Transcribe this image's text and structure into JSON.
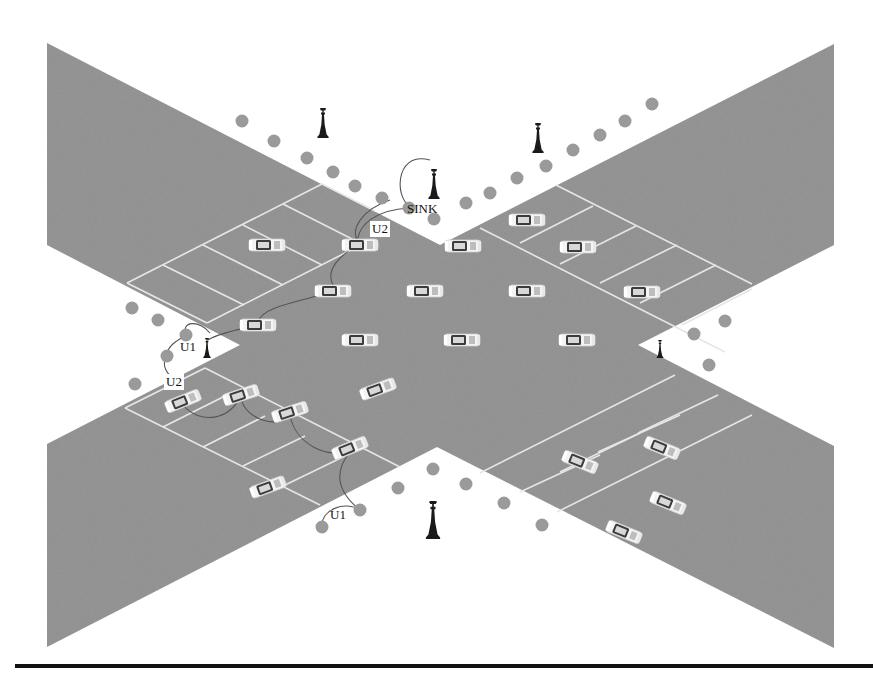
{
  "diagram": {
    "canvas": {
      "width": 873,
      "height": 685
    },
    "colors": {
      "background": "#ffffff",
      "road": "#8e8e8e",
      "road_lines": "#e6e6e6",
      "sensor_node": "#9a9a9a",
      "tower": "#1a1a1a",
      "car_body": "#f2f2f2",
      "car_cabin": "#3a3a3a",
      "link_arc": "#555555",
      "rule": "#111111"
    },
    "road_polygon": [
      [
        47,
        43
      ],
      [
        440,
        245
      ],
      [
        834,
        44
      ],
      [
        834,
        245
      ],
      [
        638,
        345
      ],
      [
        834,
        446
      ],
      [
        834,
        648
      ],
      [
        437,
        447
      ],
      [
        47,
        647
      ],
      [
        47,
        444
      ],
      [
        240,
        345
      ],
      [
        47,
        245
      ]
    ],
    "parking_lots": [
      {
        "name": "top-left",
        "lines": [
          [
            [
              127,
              283
            ],
            [
              322,
              184
            ]
          ],
          [
            [
              207,
              323
            ],
            [
              355,
              248
            ]
          ],
          [
            [
              127,
              283
            ],
            [
              207,
              323
            ]
          ],
          [
            [
              163,
              265
            ],
            [
              244,
              305
            ]
          ],
          [
            [
              203,
              245
            ],
            [
              283,
              285
            ]
          ],
          [
            [
              243,
              225
            ],
            [
              322,
              265
            ]
          ],
          [
            [
              283,
              204
            ],
            [
              354,
              240
            ]
          ],
          [
            [
              322,
              184
            ],
            [
              375,
              211
            ]
          ]
        ]
      },
      {
        "name": "top-right",
        "lines": [
          [
            [
              480,
              228
            ],
            [
              725,
              352
            ]
          ],
          [
            [
              556,
              185
            ],
            [
              752,
              284
            ]
          ],
          [
            [
              520,
              243
            ],
            [
              593,
              206
            ]
          ],
          [
            [
              560,
              264
            ],
            [
              636,
              226
            ]
          ],
          [
            [
              600,
              283
            ],
            [
              677,
              245
            ]
          ],
          [
            [
              640,
              303
            ],
            [
              716,
              265
            ]
          ],
          [
            [
              682,
              325
            ],
            [
              752,
              289
            ]
          ]
        ]
      },
      {
        "name": "bottom-left",
        "lines": [
          [
            [
              125,
              408
            ],
            [
              320,
              505
            ]
          ],
          [
            [
              205,
              368
            ],
            [
              400,
              467
            ]
          ],
          [
            [
              163,
              427
            ],
            [
              225,
              396
            ]
          ],
          [
            [
              203,
              447
            ],
            [
              265,
              416
            ]
          ],
          [
            [
              243,
              466
            ],
            [
              305,
              436
            ]
          ],
          [
            [
              283,
              486
            ],
            [
              345,
              456
            ]
          ],
          [
            [
              125,
              408
            ],
            [
              205,
              368
            ]
          ]
        ]
      },
      {
        "name": "bottom-right",
        "lines": [
          [
            [
              480,
              473
            ],
            [
              675,
              375
            ]
          ],
          [
            [
              557,
              512
            ],
            [
              752,
              415
            ]
          ],
          [
            [
              520,
              492
            ],
            [
              600,
              455
            ]
          ],
          [
            [
              560,
              472
            ],
            [
              640,
              433
            ]
          ],
          [
            [
              598,
              452
            ],
            [
              680,
              415
            ]
          ],
          [
            [
              638,
              433
            ],
            [
              718,
              395
            ]
          ]
        ]
      }
    ],
    "cars": [
      {
        "x": 267,
        "y": 245,
        "angle": 0
      },
      {
        "x": 360,
        "y": 245,
        "angle": 0
      },
      {
        "x": 463,
        "y": 246,
        "angle": 0
      },
      {
        "x": 333,
        "y": 291,
        "angle": 0
      },
      {
        "x": 425,
        "y": 291,
        "angle": 0
      },
      {
        "x": 527,
        "y": 291,
        "angle": 0
      },
      {
        "x": 258,
        "y": 325,
        "angle": 0
      },
      {
        "x": 360,
        "y": 340,
        "angle": 0
      },
      {
        "x": 462,
        "y": 340,
        "angle": 0
      },
      {
        "x": 577,
        "y": 340,
        "angle": 0
      },
      {
        "x": 378,
        "y": 389,
        "angle": -20
      },
      {
        "x": 527,
        "y": 220,
        "angle": 0
      },
      {
        "x": 578,
        "y": 247,
        "angle": 0
      },
      {
        "x": 642,
        "y": 292,
        "angle": 0
      },
      {
        "x": 183,
        "y": 401,
        "angle": -22
      },
      {
        "x": 241,
        "y": 395,
        "angle": -18
      },
      {
        "x": 290,
        "y": 412,
        "angle": -18
      },
      {
        "x": 350,
        "y": 448,
        "angle": -22
      },
      {
        "x": 268,
        "y": 487,
        "angle": -20
      },
      {
        "x": 580,
        "y": 462,
        "angle": 22
      },
      {
        "x": 662,
        "y": 448,
        "angle": 22
      },
      {
        "x": 668,
        "y": 503,
        "angle": 22
      },
      {
        "x": 624,
        "y": 532,
        "angle": 22
      }
    ],
    "sensor_nodes": [
      {
        "x": 242,
        "y": 121
      },
      {
        "x": 274,
        "y": 141
      },
      {
        "x": 307,
        "y": 158
      },
      {
        "x": 333,
        "y": 172
      },
      {
        "x": 355,
        "y": 186
      },
      {
        "x": 382,
        "y": 198
      },
      {
        "x": 409,
        "y": 208
      },
      {
        "x": 434,
        "y": 219
      },
      {
        "x": 466,
        "y": 203
      },
      {
        "x": 490,
        "y": 193
      },
      {
        "x": 517,
        "y": 178
      },
      {
        "x": 546,
        "y": 166
      },
      {
        "x": 573,
        "y": 150
      },
      {
        "x": 600,
        "y": 135
      },
      {
        "x": 625,
        "y": 121
      },
      {
        "x": 652,
        "y": 104
      },
      {
        "x": 132,
        "y": 308
      },
      {
        "x": 158,
        "y": 320
      },
      {
        "x": 186,
        "y": 335
      },
      {
        "x": 167,
        "y": 356
      },
      {
        "x": 135,
        "y": 384
      },
      {
        "x": 709,
        "y": 365
      },
      {
        "x": 725,
        "y": 321
      },
      {
        "x": 694,
        "y": 334
      },
      {
        "x": 433,
        "y": 469
      },
      {
        "x": 398,
        "y": 488
      },
      {
        "x": 466,
        "y": 484
      },
      {
        "x": 504,
        "y": 503
      },
      {
        "x": 542,
        "y": 525
      },
      {
        "x": 360,
        "y": 510
      },
      {
        "x": 322,
        "y": 527
      }
    ],
    "towers": [
      {
        "name": "tower-top-left",
        "x": 323,
        "y": 123,
        "size": 30
      },
      {
        "name": "tower-top-right",
        "x": 538,
        "y": 138,
        "size": 30
      },
      {
        "name": "tower-sink",
        "x": 434,
        "y": 184,
        "size": 30
      },
      {
        "name": "tower-left",
        "x": 207,
        "y": 348,
        "size": 20
      },
      {
        "name": "tower-right",
        "x": 660,
        "y": 349,
        "size": 18
      },
      {
        "name": "tower-bottom",
        "x": 433,
        "y": 520,
        "size": 38
      }
    ],
    "labels": [
      {
        "name": "sink-label",
        "text": "SINK",
        "x": 407,
        "y": 213,
        "boxed": false
      },
      {
        "name": "u2-label-top",
        "text": "U2",
        "x": 372,
        "y": 233,
        "boxed": true
      },
      {
        "name": "u1-label-left",
        "text": "U1",
        "x": 180,
        "y": 351,
        "boxed": false
      },
      {
        "name": "u2-label-left",
        "text": "U2",
        "x": 166,
        "y": 386,
        "boxed": true
      },
      {
        "name": "u1-label-bottom",
        "text": "U1",
        "x": 330,
        "y": 519,
        "boxed": false
      }
    ],
    "links": [
      {
        "d": "M 413 207 C 395 205, 392 150, 430 160"
      },
      {
        "d": "M 358 238 C 360 225, 375 210, 409 208"
      },
      {
        "d": "M 358 240 C 350 232, 360 210, 390 200"
      },
      {
        "d": "M 333 285 C 325 270, 340 255, 358 245"
      },
      {
        "d": "M 258 322 C 262 305, 310 300, 333 291"
      },
      {
        "d": "M 186 336 C 180 320, 200 320, 210 333"
      },
      {
        "d": "M 167 356 C 160 365, 168 375, 175 380"
      },
      {
        "d": "M 186 336 C 176 340, 166 348, 167 356"
      },
      {
        "d": "M 183 405 C 200 425, 230 420, 240 397"
      },
      {
        "d": "M 241 398 C 245 420, 280 430, 290 414"
      },
      {
        "d": "M 290 415 C 295 445, 330 460, 350 450"
      },
      {
        "d": "M 350 452 C 335 470, 335 490, 360 510"
      },
      {
        "d": "M 322 527 C 320 510, 345 500, 360 510"
      },
      {
        "d": "M 258 325 C 235 330, 215 335, 208 340"
      }
    ],
    "footer_rule": {
      "y": 666,
      "x1": 15,
      "x2": 873,
      "thickness": 4
    }
  }
}
